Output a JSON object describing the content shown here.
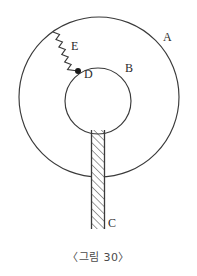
{
  "figure": {
    "caption": "〈그림 30〉",
    "stroke_color": "#3a3a3a",
    "label_color": "#2b2b2b",
    "background_color": "#ffffff",
    "labels": [
      {
        "id": "A",
        "text": "A",
        "refers_to": "outer-circle"
      },
      {
        "id": "B",
        "text": "B",
        "refers_to": "inner-circle"
      },
      {
        "id": "C",
        "text": "C",
        "refers_to": "hatched-rod"
      },
      {
        "id": "D",
        "text": "D",
        "refers_to": "attachment-point"
      },
      {
        "id": "E",
        "text": "E",
        "refers_to": "zigzag-spring"
      }
    ],
    "geometry": {
      "outer_circle": {
        "cx": 99,
        "cy": 97,
        "r": 80
      },
      "inner_circle": {
        "cx": 98,
        "cy": 101,
        "r": 33
      },
      "rod": {
        "x": 91,
        "y": 130,
        "width": 14,
        "height": 99
      },
      "point_d": {
        "cx": 78,
        "cy": 71,
        "r": 3
      },
      "spring": {
        "x1": 53,
        "y1": 32,
        "x2": 78,
        "y2": 71,
        "segments": 9,
        "amplitude": 4
      }
    }
  }
}
